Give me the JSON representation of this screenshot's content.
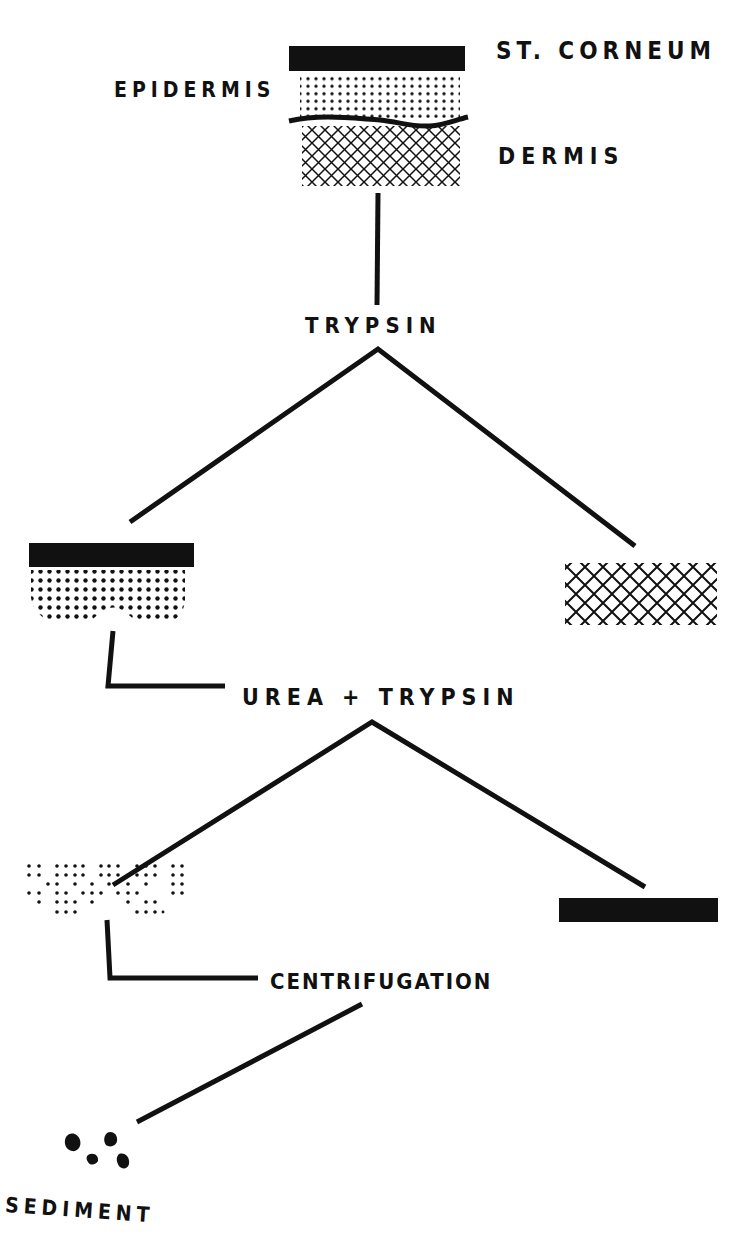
{
  "diagram": {
    "type": "flowchart",
    "colors": {
      "ink": "#111111",
      "background": "#ffffff"
    },
    "labels": {
      "st_corneum": "ST. CORNEUM",
      "epidermis": "EPIDERMIS",
      "dermis": "DERMIS",
      "step1": "TRYPSIN",
      "step2": "UREA + TRYPSIN",
      "step3": "CENTRIFUGATION",
      "result": "SEDIMENT"
    },
    "nodes": [
      {
        "id": "skin",
        "layers": [
          "st_corneum",
          "epidermis",
          "dermis"
        ]
      },
      {
        "id": "epidermis_with_corneum",
        "layers": [
          "st_corneum",
          "epidermis"
        ]
      },
      {
        "id": "dermis_separated",
        "layers": [
          "dermis"
        ]
      },
      {
        "id": "epidermal_cells",
        "layers": [
          "epidermis (dispersed)"
        ]
      },
      {
        "id": "st_corneum_separated",
        "layers": [
          "st_corneum"
        ]
      },
      {
        "id": "sediment",
        "layers": [
          "sediment"
        ]
      }
    ],
    "edges": [
      {
        "from": "skin",
        "via": "step1",
        "to": [
          "epidermis_with_corneum",
          "dermis_separated"
        ]
      },
      {
        "from": "epidermis_with_corneum",
        "via": "step2",
        "to": [
          "epidermal_cells",
          "st_corneum_separated"
        ]
      },
      {
        "from": "epidermal_cells",
        "via": "step3",
        "to": [
          "sediment"
        ]
      }
    ]
  }
}
